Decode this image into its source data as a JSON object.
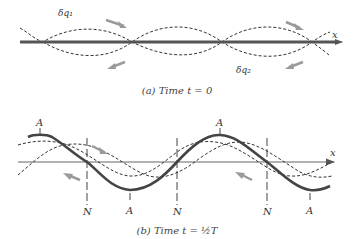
{
  "panel_a": {
    "caption": "(a) Time t = 0",
    "axis_label": "x",
    "curve_labels": {
      "upper": "δq₁",
      "lower": "δq₂"
    }
  },
  "panel_b": {
    "caption": "(b) Time t = ½T",
    "axis_label": "x",
    "antinode_labels_top": [
      "A",
      "A"
    ],
    "bottom_labels": [
      "N",
      "A",
      "N",
      "N",
      "A"
    ]
  },
  "colors": {
    "axis": "#555555",
    "standing_wave": "#444444",
    "dashed_wave": "#333333",
    "motion_arrow": "#9a9a9a",
    "text": "#333333"
  }
}
